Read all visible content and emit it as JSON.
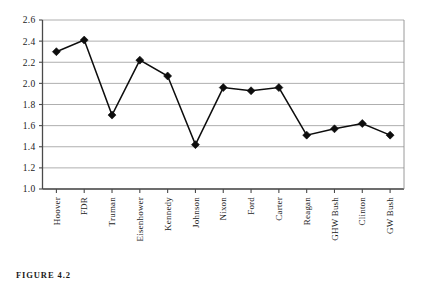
{
  "figure": {
    "caption": "FIGURE 4.2"
  },
  "chart_data": {
    "type": "line",
    "title": "",
    "xlabel": "",
    "ylabel": "",
    "ylim": [
      1.0,
      2.6
    ],
    "ytick_step": 0.2,
    "grid": true,
    "legend": "none",
    "marker": "diamond",
    "categories": [
      "Hoover",
      "FDR",
      "Truman",
      "Eisenhower",
      "Kennedy",
      "Johnson",
      "Nixon",
      "Ford",
      "Carter",
      "Reagan",
      "GHW Bush",
      "Clinton",
      "GW Bush"
    ],
    "values": [
      2.3,
      2.41,
      1.7,
      2.22,
      2.07,
      1.42,
      1.96,
      1.93,
      1.96,
      1.51,
      1.57,
      1.62,
      1.51
    ],
    "ytick_labels": [
      "1.0",
      "1.2",
      "1.4",
      "1.6",
      "1.8",
      "2.0",
      "2.2",
      "2.4",
      "2.6"
    ],
    "ytick_values": [
      1.0,
      1.2,
      1.4,
      1.6,
      1.8,
      2.0,
      2.2,
      2.4,
      2.6
    ]
  }
}
